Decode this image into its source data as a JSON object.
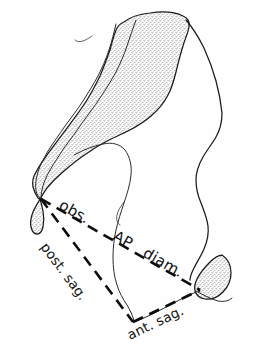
{
  "figure": {
    "name": "pelvic-outlet-diameters-diagram",
    "background_color": "#fefefe",
    "ink_color": "#111111",
    "stipple_color": "#9a9a9a"
  },
  "labels": {
    "obs": "obs.",
    "ap": "AP",
    "diam": "diam.",
    "post_sag": "post. sag.",
    "ant_sag": "ant. sag."
  },
  "measurement_lines": [
    {
      "id": "obs-ap-diam",
      "label": "obs. AP diam.",
      "style": "dashed",
      "from": {
        "x": 41,
        "y": 199
      },
      "to": {
        "x": 200,
        "y": 290
      }
    },
    {
      "id": "post-sag",
      "label": "post. sag.",
      "style": "dashed",
      "from": {
        "x": 41,
        "y": 199
      },
      "to": {
        "x": 133,
        "y": 322
      }
    },
    {
      "id": "ant-sag",
      "label": "ant. sag.",
      "style": "dashed",
      "from": {
        "x": 133,
        "y": 322
      },
      "to": {
        "x": 200,
        "y": 290
      }
    }
  ],
  "anatomy_parts": [
    {
      "id": "sacrum-body",
      "shading": "stippled"
    },
    {
      "id": "sacral-canal-band",
      "shading": "stippled"
    },
    {
      "id": "sacral-ala-band",
      "shading": "stippled"
    },
    {
      "id": "coccyx-tip",
      "shading": "stippled"
    },
    {
      "id": "pubic-symphysis",
      "shading": "stippled"
    },
    {
      "id": "ilium-outline",
      "shading": "none"
    },
    {
      "id": "ischial-spine-contour",
      "shading": "none"
    },
    {
      "id": "pelvic-outlet-curve",
      "shading": "none"
    }
  ],
  "vertices": {
    "sacrococcygeal_tip": {
      "x": 41,
      "y": 199
    },
    "coccyx_bottom": {
      "x": 133,
      "y": 322
    },
    "pubic_inferior_margin": {
      "x": 200,
      "y": 290
    }
  }
}
